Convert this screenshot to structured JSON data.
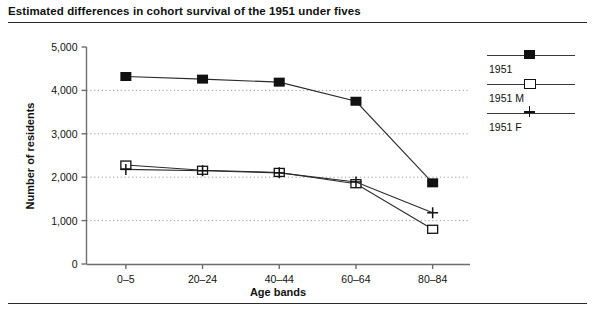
{
  "title": "Estimated differences in cohort survival of the 1951 under fives",
  "axes": {
    "ylabel": "Number of residents",
    "xlabel": "Age bands",
    "yticks": [
      "0",
      "1,000",
      "2,000",
      "3,000",
      "4,000",
      "5,000"
    ],
    "xticks": [
      "0–5",
      "20–24",
      "40–44",
      "60–64",
      "80–84"
    ]
  },
  "legend": {
    "items": [
      {
        "label": "1951",
        "marker": "filled-square"
      },
      {
        "label": "1951 M",
        "marker": "open-square"
      },
      {
        "label": "1951 F",
        "marker": "plus"
      }
    ]
  },
  "colors": {
    "line": "#2b2b2b",
    "marker": "#111111",
    "grid": "#9a9a9a",
    "axis": "#6e6e6e",
    "rule": "#2b2b2b"
  },
  "chart_data": {
    "type": "line",
    "title": "Estimated differences in cohort survival of the 1951 under fives",
    "xlabel": "Age bands",
    "ylabel": "Number of residents",
    "categories": [
      "0–5",
      "20–24",
      "40–44",
      "60–64",
      "80–84"
    ],
    "ylim": [
      0,
      5000
    ],
    "ytick_values": [
      0,
      1000,
      2000,
      3000,
      4000,
      5000
    ],
    "grid": "horizontal-dotted",
    "legend_position": "right",
    "series": [
      {
        "name": "1951",
        "marker": "filled-square",
        "values": [
          4320,
          4260,
          4190,
          3750,
          1870
        ]
      },
      {
        "name": "1951 M",
        "marker": "open-square",
        "values": [
          2280,
          2160,
          2110,
          1850,
          800
        ]
      },
      {
        "name": "1951 F",
        "marker": "plus",
        "values": [
          2180,
          2150,
          2100,
          1890,
          1180
        ]
      }
    ]
  }
}
